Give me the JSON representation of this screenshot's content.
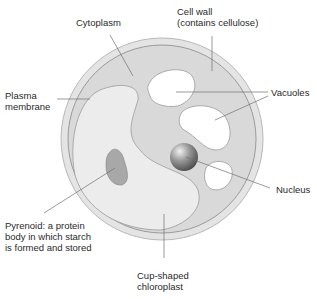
{
  "labels": {
    "cytoplasm": "Cytoplasm",
    "cell_wall_line1": "Cell wall",
    "cell_wall_line2": "(contains cellulose)",
    "plasma_line1": "Plasma",
    "plasma_line2": "membrane",
    "vacuoles": "Vacuoles",
    "nucleus": "Nucleus",
    "pyrenoid_line1": "Pyrenoid: a protein",
    "pyrenoid_line2": "body in which starch",
    "pyrenoid_line3": "is formed and stored",
    "chloroplast_line1": "Cup-shaped",
    "chloroplast_line2": "chloroplast"
  },
  "colors": {
    "cell_wall": "#e4e4e4",
    "cytoplasm": "#d9d9d9",
    "chloroplast": "#ececec",
    "vacuole": "#ffffff",
    "pyrenoid": "#a8a8a8",
    "outline": "#9a9a9a",
    "leader": "#707070"
  }
}
